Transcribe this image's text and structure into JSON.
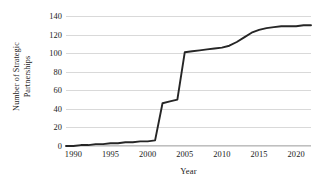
{
  "chart_data": {
    "type": "line",
    "title": "",
    "xlabel": "Year",
    "ylabel_line1": "Number of Strategic",
    "ylabel_line2": "Partnerships",
    "ylabel": "Number of Strategic Partnerships",
    "xlim": [
      1989,
      1992
    ],
    "ylim": [
      0,
      140
    ],
    "grid": true,
    "legend": "none",
    "line_color": "#262626",
    "grid_color": "#d9d9d9",
    "axis_color": "#bfbfbf",
    "x_ticks": [
      1990,
      1995,
      2000,
      2005,
      2010,
      2015,
      2020
    ],
    "y_ticks": [
      0,
      20,
      40,
      60,
      80,
      100,
      120,
      140
    ],
    "x_axis_range": [
      1989,
      2022
    ],
    "series": [
      {
        "name": "Number of Strategic Partnerships",
        "x": [
          1989,
          1990,
          1991,
          1992,
          1993,
          1994,
          1995,
          1996,
          1997,
          1998,
          1999,
          2000,
          2001,
          2002,
          2003,
          2004,
          2005,
          2006,
          2007,
          2008,
          2009,
          2010,
          2011,
          2012,
          2013,
          2014,
          2015,
          2016,
          2017,
          2018,
          2019,
          2020,
          2021,
          2022
        ],
        "values": [
          0,
          0,
          1,
          1,
          2,
          2,
          3,
          3,
          4,
          4,
          5,
          5,
          6,
          46,
          48,
          50,
          101,
          102,
          103,
          104,
          105,
          106,
          108,
          112,
          117,
          122,
          125,
          127,
          128,
          129,
          129,
          129,
          130,
          130
        ]
      }
    ]
  }
}
